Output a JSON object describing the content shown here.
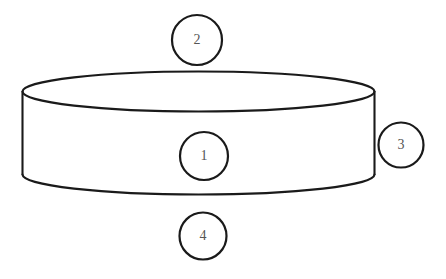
{
  "diagram": {
    "background_color": "#ffffff",
    "line_color": "#1a1a1a",
    "number_color": "#555555",
    "shape": {
      "name": "cylinder",
      "type": "3d-cylinder",
      "orientation": "upright-flat",
      "fill_color": "#ffffff",
      "stroke_color": "#1a1a1a"
    },
    "callouts": [
      {
        "id": "callout-1",
        "label": "1",
        "position": "center-of-cylinder-body",
        "cx": 204,
        "cy": 156,
        "r": 24
      },
      {
        "id": "callout-2",
        "label": "2",
        "position": "above-cylinder-top",
        "cx": 197,
        "cy": 40,
        "r": 25
      },
      {
        "id": "callout-3",
        "label": "3",
        "position": "right-of-cylinder-side",
        "cx": 401,
        "cy": 145,
        "r": 22.5
      },
      {
        "id": "callout-4",
        "label": "4",
        "position": "below-cylinder-bottom",
        "cx": 203,
        "cy": 236,
        "r": 23.5
      }
    ]
  }
}
